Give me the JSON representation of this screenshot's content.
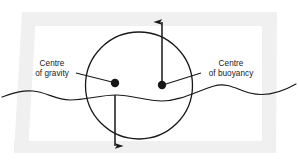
{
  "figure": {
    "width": 299,
    "height": 163,
    "background_color": "#ffffff",
    "ink_color": "#17171a",
    "scan_shadow_color": "#eeeeee"
  },
  "labels": {
    "gravity": {
      "line1": "Centre",
      "line2": "of gravity"
    },
    "buoyancy": {
      "line1": "Centre",
      "line2": "of buoyancy"
    }
  },
  "elements": {
    "body_circle": {
      "name": "floating-body-circle",
      "center_x": 139,
      "center_y": 85.5,
      "radius": 53.5
    },
    "centre_of_gravity_dot": {
      "name": "centre-of-gravity-dot",
      "x": 115,
      "y": 83,
      "radius": 4.2
    },
    "centre_of_buoyancy_dot": {
      "name": "centre-of-buoyancy-dot",
      "x": 162,
      "y": 85,
      "radius": 4.2
    },
    "weight_arrow": {
      "name": "weight-force-arrow",
      "direction": "down",
      "x": 115,
      "y_start": 95,
      "y_end": 150
    },
    "buoyancy_arrow": {
      "name": "buoyancy-force-arrow",
      "direction": "up",
      "x": 162,
      "y_start": 86,
      "y_end": 18
    },
    "water_surface": {
      "name": "water-surface-wave"
    }
  }
}
